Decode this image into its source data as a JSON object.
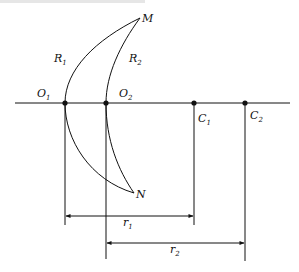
{
  "diagram": {
    "type": "optics-lens-geometry",
    "labels": {
      "M": "M",
      "N": "N",
      "R1": {
        "main": "R",
        "sub": "1"
      },
      "R2": {
        "main": "R",
        "sub": "2"
      },
      "O1": {
        "main": "O",
        "sub": "1"
      },
      "O2": {
        "main": "O",
        "sub": "2"
      },
      "C1": {
        "main": "C",
        "sub": "1"
      },
      "C2": {
        "main": "C",
        "sub": "2"
      },
      "r1": {
        "main": "r",
        "sub": "1"
      },
      "r2": {
        "main": "r",
        "sub": "2"
      }
    },
    "points": {
      "O1": [
        65,
        103
      ],
      "O2": [
        106,
        103
      ],
      "C1": [
        194,
        103
      ],
      "C2": [
        245,
        103
      ],
      "M": [
        140,
        18
      ],
      "N": [
        134,
        193
      ]
    },
    "colors": {
      "line": "#111111",
      "background": "#ffffff"
    }
  }
}
